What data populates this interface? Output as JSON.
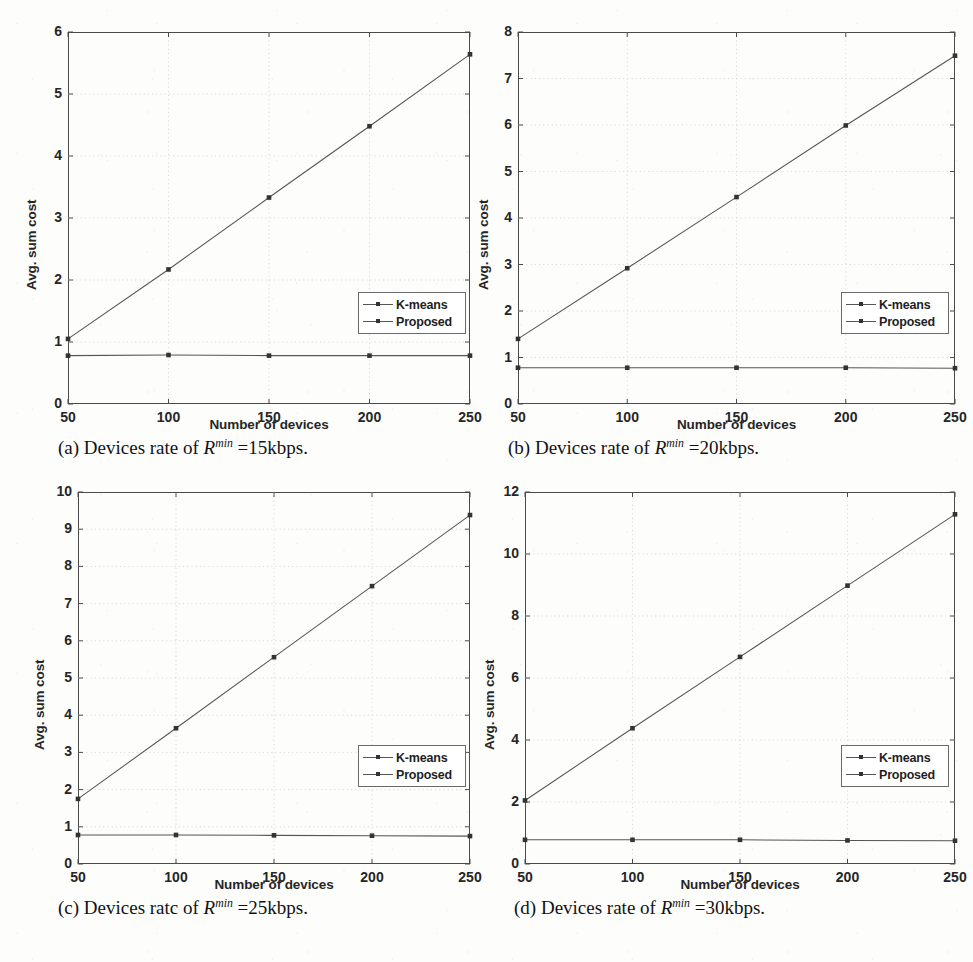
{
  "figure": {
    "background_color": "#fdfdfc",
    "line_color": "#555555",
    "marker_color": "#333333",
    "axis_color": "#4a4a4a",
    "grid_color": "#cccccc"
  },
  "common": {
    "xlabel": "Number of devices",
    "ylabel": "Avg. sum cost",
    "xticks": [
      "50",
      "100",
      "150",
      "200",
      "250"
    ],
    "legend": {
      "items": [
        {
          "label": "K-means",
          "marker": "square-marker"
        },
        {
          "label": "Proposed",
          "marker": "square-marker"
        }
      ]
    }
  },
  "captions": {
    "a": {
      "index": "(a)",
      "prefix": "Devices rate of",
      "symbol": "R",
      "exponent": "min",
      "value": "=15kbps."
    },
    "b": {
      "index": "(b)",
      "prefix": "Devices rate of",
      "symbol": "R",
      "exponent": "min",
      "value": "=20kbps."
    },
    "c": {
      "index": "(c)",
      "prefix": "Devices ratc of",
      "symbol": "R",
      "exponent": "min",
      "value": "=25kbps."
    },
    "d": {
      "index": "(d)",
      "prefix": "Devices rate of",
      "symbol": "R",
      "exponent": "min",
      "value": "=30kbps."
    }
  },
  "chart_data": [
    {
      "id": "a",
      "type": "line",
      "title": "(a) Devices rate of R^min =15kbps.",
      "xlabel": "Number of devices",
      "ylabel": "Avg. sum cost",
      "x": [
        50,
        100,
        150,
        200,
        250
      ],
      "xlim": [
        50,
        250
      ],
      "ylim": [
        0,
        6
      ],
      "yticks": [
        0,
        1,
        2,
        3,
        4,
        5,
        6
      ],
      "xticks": [
        50,
        100,
        150,
        200,
        250
      ],
      "grid": true,
      "legend_position": "center-right",
      "series": [
        {
          "name": "K-means",
          "values": [
            1.05,
            2.17,
            3.33,
            4.48,
            5.64
          ]
        },
        {
          "name": "Proposed",
          "values": [
            0.78,
            0.79,
            0.78,
            0.78,
            0.78
          ]
        }
      ]
    },
    {
      "id": "b",
      "type": "line",
      "title": "(b) Devices rate of R^min =20kbps.",
      "xlabel": "Number of devices",
      "ylabel": "Avg. sum cost",
      "x": [
        50,
        100,
        150,
        200,
        250
      ],
      "xlim": [
        50,
        250
      ],
      "ylim": [
        0,
        8
      ],
      "yticks": [
        0,
        1,
        2,
        3,
        4,
        5,
        6,
        7,
        8
      ],
      "xticks": [
        50,
        100,
        150,
        200,
        250
      ],
      "grid": true,
      "legend_position": "center-right",
      "series": [
        {
          "name": "K-means",
          "values": [
            1.4,
            2.92,
            4.45,
            5.99,
            7.49
          ]
        },
        {
          "name": "Proposed",
          "values": [
            0.78,
            0.78,
            0.78,
            0.78,
            0.77
          ]
        }
      ]
    },
    {
      "id": "c",
      "type": "line",
      "title": "(c) Devices ratc of R^min =25kbps.",
      "xlabel": "Number of devices",
      "ylabel": "Avg. sum cost",
      "x": [
        50,
        100,
        150,
        200,
        250
      ],
      "xlim": [
        50,
        250
      ],
      "ylim": [
        0,
        10
      ],
      "yticks": [
        0,
        1,
        2,
        3,
        4,
        5,
        6,
        7,
        8,
        9,
        10
      ],
      "xticks": [
        50,
        100,
        150,
        200,
        250
      ],
      "grid": true,
      "legend_position": "lower-right",
      "series": [
        {
          "name": "K-means",
          "values": [
            1.75,
            3.65,
            5.56,
            7.47,
            9.38
          ]
        },
        {
          "name": "Proposed",
          "values": [
            0.78,
            0.78,
            0.77,
            0.76,
            0.75
          ]
        }
      ]
    },
    {
      "id": "d",
      "type": "line",
      "title": "(d) Devices rate of R^min =30kbps.",
      "xlabel": "Number of devices",
      "ylabel": "Avg. sum cost",
      "x": [
        50,
        100,
        150,
        200,
        250
      ],
      "xlim": [
        50,
        250
      ],
      "ylim": [
        0,
        12
      ],
      "yticks": [
        0,
        2,
        4,
        6,
        8,
        10,
        12
      ],
      "xticks": [
        50,
        100,
        150,
        200,
        250
      ],
      "grid": true,
      "legend_position": "lower-right",
      "series": [
        {
          "name": "K-means",
          "values": [
            2.05,
            4.38,
            6.68,
            8.98,
            11.28
          ]
        },
        {
          "name": "Proposed",
          "values": [
            0.78,
            0.78,
            0.78,
            0.76,
            0.75
          ]
        }
      ]
    }
  ]
}
